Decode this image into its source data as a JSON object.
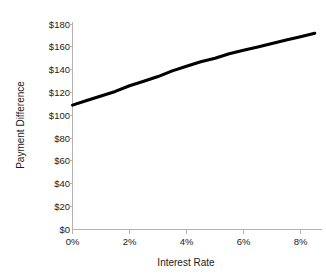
{
  "chart_data": {
    "type": "line",
    "title": "",
    "xlabel": "Interest Rate",
    "ylabel": "Payment Difference",
    "grid": false,
    "legend": false,
    "legend_position": "none",
    "xlim": [
      0,
      9
    ],
    "ylim": [
      0,
      180
    ],
    "x_tick_labels": [
      "0%",
      "2%",
      "4%",
      "6%",
      "8%"
    ],
    "x_tick_values": [
      0,
      2,
      4,
      6,
      8
    ],
    "y_tick_labels": [
      "$0",
      "$20",
      "$40",
      "$60",
      "$80",
      "$100",
      "$120",
      "$140",
      "$160",
      "$180"
    ],
    "y_tick_values": [
      0,
      20,
      40,
      60,
      80,
      100,
      120,
      140,
      160,
      180
    ],
    "series": [
      {
        "name": "Payment Difference",
        "color": "#000000",
        "x": [
          0,
          0.5,
          1,
          1.5,
          2,
          2.5,
          3,
          3.5,
          4,
          4.5,
          5,
          5.5,
          6,
          6.5,
          7,
          7.5,
          8,
          8.5
        ],
        "values": [
          109,
          113,
          117,
          121,
          126,
          130,
          134,
          139,
          143,
          147,
          150,
          154,
          157,
          160,
          163,
          166,
          169,
          172
        ]
      }
    ],
    "axis_color": "#b4b4b4",
    "background_color": "#ffffff"
  },
  "labels": {
    "x_axis_title": "Interest Rate",
    "y_axis_title": "Payment Difference",
    "y0": "$0",
    "y20": "$20",
    "y40": "$40",
    "y60": "$60",
    "y80": "$80",
    "y100": "$100",
    "y120": "$120",
    "y140": "$140",
    "y160": "$160",
    "y180": "$180",
    "x0": "0%",
    "x2": "2%",
    "x4": "4%",
    "x6": "6%",
    "x8": "8%"
  }
}
